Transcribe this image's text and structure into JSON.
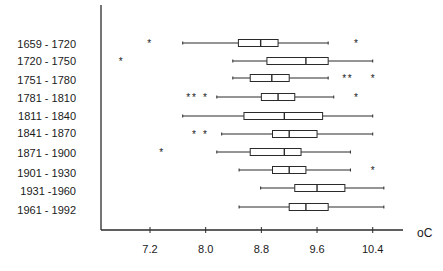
{
  "chart_data": {
    "type": "boxplot",
    "orientation": "horizontal",
    "title": "",
    "xlabel": "oC",
    "ylabel": "",
    "xlim": [
      6.5,
      10.9
    ],
    "x_ticks": [
      7.2,
      8.0,
      8.8,
      9.6,
      10.4
    ],
    "x_tick_labels": [
      "7.2",
      "8.0",
      "8.8",
      "9.6",
      "10.4"
    ],
    "grid": false,
    "legend": null,
    "categories": [
      "1659 - 1720",
      "1720 - 1750",
      "1751 - 1780",
      "1781 - 1810",
      "1811 - 1840",
      "1841 - 1870",
      "1871 - 1900",
      "1901 - 1930",
      "1931 -1960",
      "1961 - 1992"
    ],
    "series": [
      {
        "name": "1659 - 1720",
        "whisker_low": 7.67,
        "q1": 8.47,
        "median": 8.79,
        "q3": 9.04,
        "whisker_high": 9.76,
        "outliers": [
          7.19,
          10.16
        ]
      },
      {
        "name": "1720 - 1750",
        "whisker_low": 8.39,
        "q1": 8.88,
        "median": 9.44,
        "q3": 9.76,
        "whisker_high": 10.4,
        "outliers": [
          6.78
        ]
      },
      {
        "name": "1751 - 1780",
        "whisker_low": 8.39,
        "q1": 8.64,
        "median": 8.95,
        "q3": 9.2,
        "whisker_high": 9.76,
        "outliers": [
          9.99,
          10.07,
          10.4
        ]
      },
      {
        "name": "1781 - 1810",
        "whisker_low": 8.16,
        "q1": 8.8,
        "median": 9.04,
        "q3": 9.28,
        "whisker_high": 9.84,
        "outliers": [
          7.75,
          7.83,
          7.99,
          10.16
        ]
      },
      {
        "name": "1811 - 1840",
        "whisker_low": 7.67,
        "q1": 8.55,
        "median": 9.13,
        "q3": 9.68,
        "whisker_high": 10.4,
        "outliers": []
      },
      {
        "name": "1841 - 1870",
        "whisker_low": 8.23,
        "q1": 8.96,
        "median": 9.2,
        "q3": 9.6,
        "whisker_high": 10.4,
        "outliers": [
          7.83,
          7.99
        ]
      },
      {
        "name": "1871 - 1900",
        "whisker_low": 8.16,
        "q1": 8.64,
        "median": 9.13,
        "q3": 9.37,
        "whisker_high": 10.08,
        "outliers": [
          7.36
        ]
      },
      {
        "name": "1901 - 1930",
        "whisker_low": 8.48,
        "q1": 8.96,
        "median": 9.2,
        "q3": 9.44,
        "whisker_high": 10.08,
        "outliers": [
          10.4
        ]
      },
      {
        "name": "1931 -1960",
        "whisker_low": 8.79,
        "q1": 9.28,
        "median": 9.6,
        "q3": 10.0,
        "whisker_high": 10.56,
        "outliers": []
      },
      {
        "name": "1961 - 1992",
        "whisker_low": 8.48,
        "q1": 9.2,
        "median": 9.44,
        "q3": 9.76,
        "whisker_high": 10.56,
        "outliers": []
      }
    ]
  },
  "layout": {
    "row_y": [
      43,
      61,
      78,
      97,
      116,
      134,
      152,
      170,
      188,
      207
    ],
    "label_y": [
      48,
      65,
      84,
      102,
      120,
      137,
      157,
      177,
      195,
      214
    ],
    "colors": {
      "line": "#2a2a2a",
      "text": "#1a1a1a",
      "background": "#ffffff"
    }
  }
}
